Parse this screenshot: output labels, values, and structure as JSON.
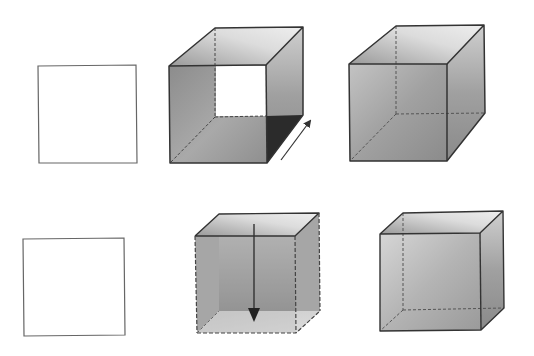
{
  "diagram": {
    "rows": [
      {
        "id": "top",
        "steps": [
          {
            "label": "square",
            "kind": "square"
          },
          {
            "label": "square extruded diagonally into cube (arrow along depth)",
            "kind": "cube-extrusion-depth"
          },
          {
            "label": "completed cube",
            "kind": "cube"
          }
        ],
        "arrow_direction": "up-right (depth)"
      },
      {
        "id": "bottom",
        "steps": [
          {
            "label": "square",
            "kind": "square"
          },
          {
            "label": "square swept downward into cube (arrow down)",
            "kind": "cube-extrusion-height"
          },
          {
            "label": "completed cube",
            "kind": "cube"
          }
        ],
        "arrow_direction": "down (height)"
      }
    ],
    "colors": {
      "stroke": "#333333",
      "hidden_edge": "#555555",
      "face_dark": "#8a8a8a",
      "face_mid": "#b0b0b0",
      "face_light": "#e6e6e6",
      "corner_dark": "#2a2a2a",
      "background": "#ffffff"
    }
  }
}
